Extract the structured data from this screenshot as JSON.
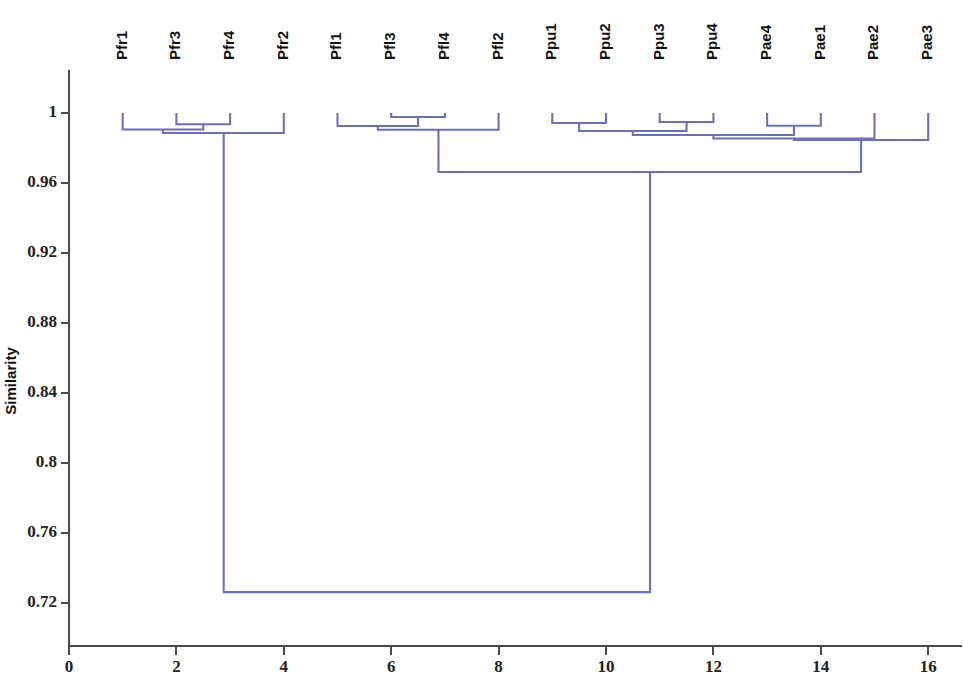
{
  "chart_data": {
    "type": "line",
    "subtype": "dendrogram",
    "title": "",
    "subtitle": "",
    "xlabel": "",
    "ylabel": "Similarity",
    "xlim": [
      0,
      16.2
    ],
    "ylim": [
      0.7,
      1.005
    ],
    "grid": false,
    "legend": null,
    "line_color": "#6b6fc4",
    "axis_color": "#4a4a4a",
    "yticks": [
      "1",
      "0.96",
      "0.92",
      "0.88",
      "0.84",
      "0.8",
      "0.76",
      "0.72"
    ],
    "ytick_values": [
      1,
      0.96,
      0.92,
      0.88,
      0.84,
      0.8,
      0.76,
      0.72
    ],
    "xticks": [
      "0",
      "2",
      "4",
      "6",
      "8",
      "10",
      "12",
      "14",
      "16"
    ],
    "xtick_values": [
      0,
      2,
      4,
      6,
      8,
      10,
      12,
      14,
      16
    ],
    "leaf_labels": [
      "Pfr1",
      "Pfr3",
      "Pfr4",
      "Pfr2",
      "Pfl1",
      "Pfl3",
      "Pfl4",
      "Pfl2",
      "Ppu1",
      "Ppu2",
      "Ppu3",
      "Ppu4",
      "Pae4",
      "Pae1",
      "Pae2",
      "Pae3"
    ],
    "leaf_positions": [
      1,
      2,
      3,
      4,
      5,
      6,
      7,
      8,
      9,
      10,
      11,
      12,
      13,
      14,
      15,
      16
    ],
    "leaf_similarity": 1.0,
    "merges": [
      {
        "id": "m1",
        "left": 2,
        "right": 3,
        "x": 2.5,
        "similarity": 0.9936,
        "children": [
          "Pfr3",
          "Pfr4"
        ]
      },
      {
        "id": "m2",
        "left": 1,
        "right": 2.5,
        "x": 1.75,
        "similarity": 0.9906,
        "children": [
          "Pfr1",
          "m1"
        ]
      },
      {
        "id": "m3",
        "left": 1.75,
        "right": 4,
        "x": 2.88,
        "similarity": 0.9886,
        "children": [
          "m2",
          "Pfr2"
        ]
      },
      {
        "id": "m4",
        "left": 6,
        "right": 7,
        "x": 6.5,
        "similarity": 0.9977,
        "children": [
          "Pfl3",
          "Pfl4"
        ]
      },
      {
        "id": "m5",
        "left": 5,
        "right": 6.5,
        "x": 5.75,
        "similarity": 0.9926,
        "children": [
          "Pfl1",
          "m4"
        ]
      },
      {
        "id": "m6",
        "left": 5.75,
        "right": 8,
        "x": 6.88,
        "similarity": 0.9904,
        "children": [
          "m5",
          "Pfl2"
        ]
      },
      {
        "id": "m7",
        "left": 9,
        "right": 10,
        "x": 9.5,
        "similarity": 0.9943,
        "children": [
          "Ppu1",
          "Ppu2"
        ]
      },
      {
        "id": "m8",
        "left": 11,
        "right": 12,
        "x": 11.5,
        "similarity": 0.9949,
        "children": [
          "Ppu3",
          "Ppu4"
        ]
      },
      {
        "id": "m9",
        "left": 9.5,
        "right": 11.5,
        "x": 10.5,
        "similarity": 0.9897,
        "children": [
          "m7",
          "m8"
        ]
      },
      {
        "id": "m10",
        "left": 13,
        "right": 14,
        "x": 13.5,
        "similarity": 0.9927,
        "children": [
          "Pae4",
          "Pae1"
        ]
      },
      {
        "id": "m11",
        "left": 10.5,
        "right": 13.5,
        "x": 12.0,
        "similarity": 0.9874,
        "children": [
          "m9",
          "m10"
        ]
      },
      {
        "id": "m12",
        "left": 12.0,
        "right": 15,
        "x": 13.5,
        "similarity": 0.9854,
        "children": [
          "m11",
          "Pae2"
        ]
      },
      {
        "id": "m13",
        "left": 13.5,
        "right": 16,
        "x": 14.75,
        "similarity": 0.9846,
        "children": [
          "m12",
          "Pae3"
        ]
      },
      {
        "id": "m14",
        "left": 6.88,
        "right": 14.75,
        "x": 10.82,
        "similarity": 0.9663,
        "children": [
          "m6",
          "m13"
        ]
      },
      {
        "id": "m15",
        "left": 2.88,
        "right": 10.82,
        "x": 6.85,
        "similarity": 0.7262,
        "children": [
          "m3",
          "m14"
        ]
      }
    ]
  },
  "figure": {
    "axis_title_y": "Similarity"
  }
}
